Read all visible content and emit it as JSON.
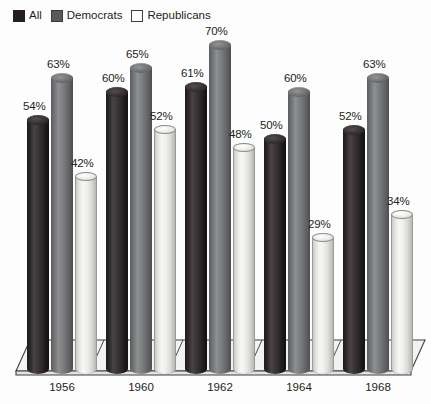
{
  "legend": {
    "items": [
      {
        "label": "All",
        "swatch": "black-swatch-icon",
        "color": "#231f20"
      },
      {
        "label": "Democrats",
        "swatch": "dark-gray-swatch-icon",
        "color": "#58595b"
      },
      {
        "label": "Republicans",
        "swatch": "white-swatch-icon",
        "color": "#ffffff"
      }
    ]
  },
  "chart_data": {
    "type": "bar",
    "title": "",
    "subtitle": "",
    "xlabel": "",
    "ylabel": "",
    "ylim": [
      0,
      75
    ],
    "grid": false,
    "legend_position": "top-left",
    "style": "3d-cylinder",
    "value_suffix": "%",
    "categories": [
      "1956",
      "1960",
      "1962",
      "1964",
      "1968"
    ],
    "series": [
      {
        "name": "All",
        "color": "#231f20",
        "values": [
          54,
          60,
          61,
          50,
          52
        ],
        "labels": [
          "54%",
          "60%",
          "61%",
          "50%",
          "52%"
        ]
      },
      {
        "name": "Democrats",
        "color": "#58595b",
        "values": [
          63,
          65,
          70,
          60,
          63
        ],
        "labels": [
          "63%",
          "65%",
          "70%",
          "60%",
          "63%"
        ]
      },
      {
        "name": "Republicans",
        "color": "#ffffff",
        "values": [
          42,
          52,
          48,
          29,
          34
        ],
        "labels": [
          "42%",
          "52%",
          "48%",
          "29%",
          "34%"
        ]
      }
    ]
  },
  "axis": {
    "tick_labels": [
      "1956",
      "1960",
      "1962",
      "1964",
      "1968"
    ]
  }
}
